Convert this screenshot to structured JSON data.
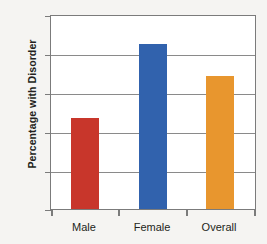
{
  "chart_data": {
    "type": "bar",
    "title": "",
    "subtitle": "",
    "xlabel": "",
    "ylabel": "Percentage with Disorder",
    "categories": [
      "Male",
      "Female",
      "Overall"
    ],
    "values": [
      11.7,
      21.2,
      17.0
    ],
    "series": [
      {
        "name": "Percentage with Disorder",
        "values": [
          11.7,
          21.2,
          17.0
        ]
      }
    ],
    "bar_colors": [
      "#c8362b",
      "#3162ad",
      "#e8962e"
    ],
    "ylim": [
      0,
      25
    ],
    "yticks": [
      0,
      5,
      10,
      15,
      20,
      25
    ],
    "ytick_labels": [
      "0",
      "5",
      "10",
      "15",
      "20",
      "25"
    ],
    "grid": true,
    "grid_axis": "y",
    "legend": false,
    "legend_position": "none",
    "background_color": "#f5f4f2",
    "plot_background_color": "#ffffff",
    "axis_color": "#7b7b7b",
    "gridline_color": "#8a8a8a",
    "text_color": "#231f20",
    "annotations": []
  }
}
